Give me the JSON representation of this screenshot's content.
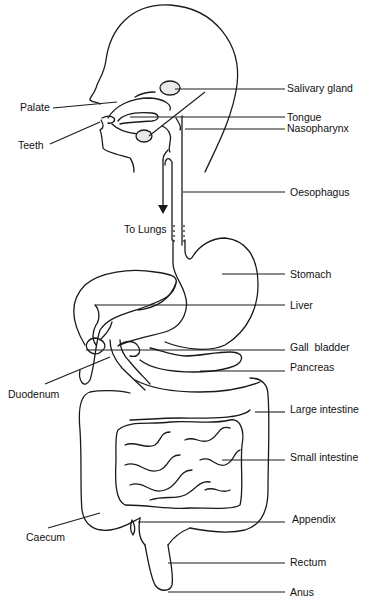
{
  "arrow_label": "To Lungs",
  "labels": {
    "salivary_gland": "Salivary gland",
    "palate": "Palate",
    "tongue": "Tongue",
    "nasopharynx": "Nasopharynx",
    "teeth": "Teeth",
    "oesophagus": "Oesophagus",
    "stomach": "Stomach",
    "liver": "Liver",
    "gall_bladder": "Gall  bladder",
    "pancreas": "Pancreas",
    "duodenum": "Duodenum",
    "large_intestine": "Large intestine",
    "small_intestine": "Small intestine",
    "appendix": "Appendix",
    "caecum": "Caecum",
    "rectum": "Rectum",
    "anus": "Anus"
  }
}
